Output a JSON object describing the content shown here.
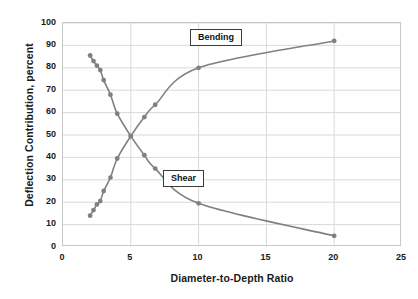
{
  "chart_data": {
    "type": "line",
    "title": "",
    "xlabel": "Diameter-to-Depth Ratio",
    "ylabel": "Deflection Contribution, percent",
    "xlim": [
      0,
      25
    ],
    "ylim": [
      0,
      100
    ],
    "xticks": [
      0,
      5,
      10,
      15,
      20,
      25
    ],
    "yticks": [
      0,
      10,
      20,
      30,
      40,
      50,
      60,
      70,
      80,
      90,
      100
    ],
    "grid": "horizontal-and-vertical",
    "legend": "inline-callouts",
    "series": [
      {
        "name": "Shear",
        "color": "#808080",
        "x": [
          2.0,
          2.25,
          2.5,
          2.75,
          3.0,
          3.5,
          4.0,
          5.0,
          6.0,
          6.8,
          10.0,
          20.0
        ],
        "y": [
          85.5,
          83.0,
          81.0,
          79.0,
          74.5,
          68.0,
          59.5,
          49.5,
          41.0,
          35.0,
          19.5,
          5.0
        ]
      },
      {
        "name": "Bending",
        "color": "#808080",
        "x": [
          2.0,
          2.25,
          2.5,
          2.75,
          3.0,
          3.5,
          4.0,
          5.0,
          6.0,
          6.8,
          10.0,
          20.0
        ],
        "y": [
          14.0,
          16.5,
          19.0,
          20.5,
          25.0,
          31.0,
          39.5,
          49.5,
          58.0,
          63.5,
          80.0,
          92.0
        ]
      }
    ],
    "annotations": [
      {
        "label": "Bending",
        "x": 10.0,
        "y": 88.0
      },
      {
        "label": "Shear",
        "x": 7.8,
        "y": 28.0
      }
    ]
  },
  "axis": {
    "y_title": "Deflection Contribution, percent",
    "x_title": "Diameter-to-Depth Ratio",
    "y_tick_labels": [
      "100",
      "90",
      "80",
      "70",
      "60",
      "50",
      "40",
      "30",
      "20",
      "10",
      "0"
    ],
    "x_tick_labels": [
      "0",
      "5",
      "10",
      "15",
      "20",
      "25"
    ]
  },
  "callouts": {
    "bending": "Bending",
    "shear": "Shear"
  },
  "colors": {
    "series": "#808080",
    "grid": "#d9d9d9",
    "frame": "#c8c8c8",
    "text": "#1a1a1a",
    "callout_border": "#3a3a3a",
    "background": "#ffffff"
  }
}
